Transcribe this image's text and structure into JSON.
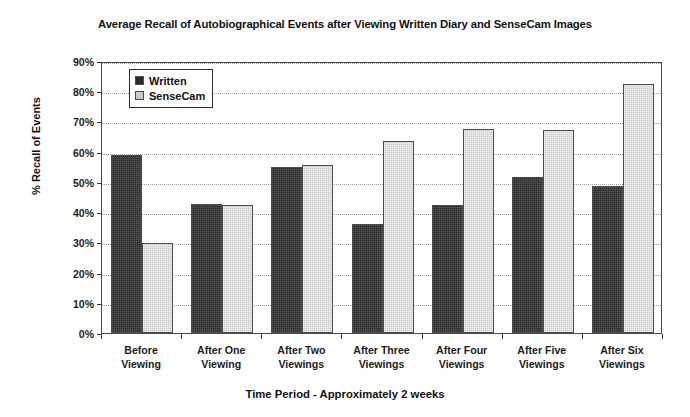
{
  "chart_data": {
    "type": "bar",
    "title": "Average Recall of Autobiographical Events after Viewing Written Diary and SenseCam Images",
    "xlabel": "Time Period - Approximately 2 weeks",
    "ylabel": "% Recall of Events",
    "categories": [
      "Before Viewing",
      "After One Viewing",
      "After Two Viewings",
      "After Three Viewings",
      "After Four Viewings",
      "After Five Viewings",
      "After Six Viewings"
    ],
    "category_lines": [
      [
        "Before",
        "Viewing"
      ],
      [
        "After One",
        "Viewing"
      ],
      [
        "After Two",
        "Viewings"
      ],
      [
        "After Three",
        "Viewings"
      ],
      [
        "After Four",
        "Viewings"
      ],
      [
        "After Five",
        "Viewings"
      ],
      [
        "After Six",
        "Viewings"
      ]
    ],
    "series": [
      {
        "name": "Written",
        "color": "#2a2a2a",
        "values": [
          58.8,
          42.8,
          54.8,
          36.0,
          42.5,
          51.5,
          48.5
        ]
      },
      {
        "name": "SenseCam",
        "color": "#c9c9c9",
        "values": [
          29.7,
          42.2,
          55.6,
          63.6,
          67.5,
          67.3,
          82.5
        ]
      }
    ],
    "ylim": [
      0,
      90
    ],
    "ytick_values": [
      0,
      10,
      20,
      30,
      40,
      50,
      60,
      70,
      80,
      90
    ],
    "ytick_labels": [
      "0%",
      "10%",
      "20%",
      "30%",
      "40%",
      "50%",
      "60%",
      "70%",
      "80%",
      "90%"
    ],
    "grid": true,
    "grid_axis": "y",
    "legend_position": "upper left",
    "legend_entries": [
      "Written",
      "SenseCam"
    ]
  }
}
